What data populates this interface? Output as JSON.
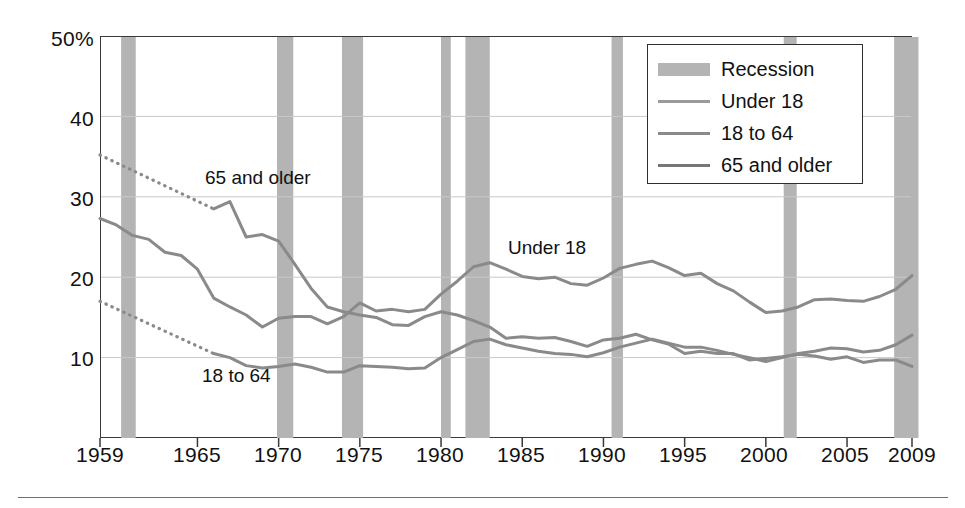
{
  "chart_data": {
    "type": "line",
    "title": "",
    "subtitle": "",
    "xlabel": "",
    "ylabel": "",
    "xlim": [
      1959,
      2009
    ],
    "ylim": [
      0,
      50
    ],
    "yticks": [
      "50%",
      "40",
      "30",
      "20",
      "10"
    ],
    "ytick_values": [
      50,
      40,
      30,
      20,
      10
    ],
    "xticks": [
      "1959",
      "1965",
      "1970",
      "1975",
      "1980",
      "1985",
      "1990",
      "1995",
      "2000",
      "2005",
      "2009"
    ],
    "xtick_values": [
      1959,
      1965,
      1970,
      1975,
      1980,
      1985,
      1990,
      1995,
      2000,
      2005,
      2009
    ],
    "grid": "horizontal",
    "legend_position": "top-right",
    "x": [
      1959,
      1960,
      1961,
      1962,
      1963,
      1964,
      1965,
      1966,
      1967,
      1968,
      1969,
      1970,
      1971,
      1972,
      1973,
      1974,
      1975,
      1976,
      1977,
      1978,
      1979,
      1980,
      1981,
      1982,
      1983,
      1984,
      1985,
      1986,
      1987,
      1988,
      1989,
      1990,
      1991,
      1992,
      1993,
      1994,
      1995,
      1996,
      1997,
      1998,
      1999,
      2000,
      2001,
      2002,
      2003,
      2004,
      2005,
      2006,
      2007,
      2008,
      2009
    ],
    "series": [
      {
        "name": "Under 18",
        "color": "#8a8a8a",
        "style": "solid",
        "values": [
          27.3,
          26.5,
          25.2,
          24.7,
          23.1,
          22.7,
          21.0,
          17.4,
          16.3,
          15.3,
          13.8,
          14.9,
          15.1,
          15.1,
          14.2,
          15.1,
          16.8,
          15.8,
          16.0,
          15.7,
          16.0,
          17.9,
          19.5,
          21.3,
          21.8,
          21.0,
          20.1,
          19.8,
          20.0,
          19.2,
          19.0,
          19.9,
          21.1,
          21.6,
          22.0,
          21.2,
          20.2,
          20.5,
          19.2,
          18.3,
          16.9,
          15.6,
          15.8,
          16.3,
          17.2,
          17.3,
          17.1,
          17.0,
          17.6,
          18.5,
          20.2
        ]
      },
      {
        "name": "18 to 64",
        "color": "#8a8a8a",
        "style": "solid",
        "values": [
          null,
          null,
          null,
          null,
          null,
          null,
          null,
          10.5,
          10.0,
          9.0,
          8.7,
          8.9,
          9.2,
          8.8,
          8.2,
          8.2,
          9.0,
          8.9,
          8.8,
          8.6,
          8.7,
          10.0,
          11.0,
          12.0,
          12.3,
          11.6,
          11.2,
          10.8,
          10.5,
          10.4,
          10.1,
          10.6,
          11.3,
          11.8,
          12.3,
          11.8,
          11.3,
          11.3,
          10.9,
          10.4,
          10.0,
          9.5,
          10.0,
          10.5,
          10.8,
          11.2,
          11.1,
          10.7,
          10.9,
          11.6,
          12.8
        ]
      },
      {
        "name": "65 and older",
        "color": "#8a8a8a",
        "style": "solid",
        "values": [
          null,
          null,
          null,
          null,
          null,
          null,
          null,
          28.5,
          29.4,
          25.0,
          25.3,
          24.5,
          21.6,
          18.6,
          16.3,
          15.7,
          15.3,
          15.0,
          14.1,
          14.0,
          15.1,
          15.7,
          15.3,
          14.6,
          13.8,
          12.4,
          12.6,
          12.4,
          12.5,
          12.0,
          11.4,
          12.2,
          12.4,
          12.9,
          12.2,
          11.7,
          10.5,
          10.8,
          10.5,
          10.5,
          9.7,
          9.9,
          10.1,
          10.4,
          10.2,
          9.8,
          10.1,
          9.4,
          9.7,
          9.7,
          8.9
        ]
      }
    ],
    "dotted_segments": [
      {
        "name": "65 and older (estimated)",
        "x": [
          1959,
          1966
        ],
        "values": [
          35.2,
          28.5
        ],
        "style": "dotted",
        "color": "#8a8a8a"
      },
      {
        "name": "18 to 64 (estimated)",
        "x": [
          1959,
          1966
        ],
        "values": [
          17.0,
          10.5
        ],
        "style": "dotted",
        "color": "#8a8a8a"
      }
    ],
    "recessions": [
      {
        "start": 1960.3,
        "end": 1961.2
      },
      {
        "start": 1969.9,
        "end": 1970.9
      },
      {
        "start": 1973.9,
        "end": 1975.2
      },
      {
        "start": 1980.0,
        "end": 1980.6
      },
      {
        "start": 1981.5,
        "end": 1983.0
      },
      {
        "start": 1990.5,
        "end": 1991.2
      },
      {
        "start": 2001.1,
        "end": 2001.9
      },
      {
        "start": 2007.9,
        "end": 2009.4
      }
    ],
    "annotations": [
      {
        "text": "65 and older",
        "x_px": 205,
        "y_px": 168
      },
      {
        "text": "Under 18",
        "x_px": 508,
        "y_px": 238
      },
      {
        "text": "18 to 64",
        "x_px": 202,
        "y_px": 366
      }
    ],
    "colors": {
      "line": "#8a8a8a",
      "recession_band": "#b4b4b4",
      "grid": "#c9c9c9",
      "frame": "#3a3a3a",
      "text": "#111111",
      "background": "#ffffff"
    }
  },
  "legend": {
    "items": [
      {
        "label": "Recession",
        "kind": "swatch",
        "color": "#b4b4b4"
      },
      {
        "label": "Under 18",
        "kind": "line",
        "color": "#9a9a9a"
      },
      {
        "label": "18 to 64",
        "kind": "line",
        "color": "#8a8a8a"
      },
      {
        "label": "65 and older",
        "kind": "line",
        "color": "#777777"
      }
    ]
  }
}
